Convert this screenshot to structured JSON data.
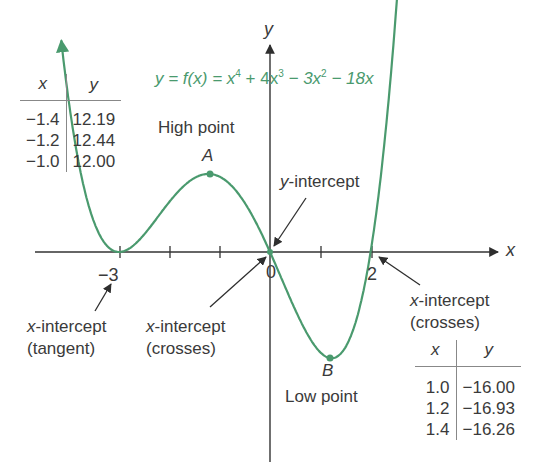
{
  "equation": {
    "lhs": "y = f(x) = ",
    "terms": [
      "x",
      "4",
      " + 4x",
      "3",
      " − 3x",
      "2",
      " − 18x"
    ],
    "text": "y = f(x) = x⁴ + 4x³ − 3x² − 18x",
    "color": "#4a9a6e"
  },
  "axes": {
    "x_label": "x",
    "y_label": "y",
    "tick_labels": {
      "neg3": "−3",
      "zero": "0",
      "two": "2"
    }
  },
  "annotations": {
    "high_point_label": "High point",
    "point_a": "A",
    "low_point_label": "Low point",
    "point_b": "B",
    "y_intercept": "y-intercept",
    "x_int_tangent_line1": "x-intercept",
    "x_int_tangent_line2": "(tangent)",
    "x_int_cross0_line1": "x-intercept",
    "x_int_cross0_line2": "(crosses)",
    "x_int_cross2_line1": "x-intercept",
    "x_int_cross2_line2": "(crosses)"
  },
  "table_high": {
    "headers": [
      "x",
      "y"
    ],
    "rows": [
      [
        "−1.4",
        "12.19"
      ],
      [
        "−1.2",
        "12.44"
      ],
      [
        "−1.0",
        "12.00"
      ]
    ]
  },
  "table_low": {
    "headers": [
      "x",
      "y"
    ],
    "rows": [
      [
        "1.0",
        "−16.00"
      ],
      [
        "1.2",
        "−16.93"
      ],
      [
        "1.4",
        "−16.26"
      ]
    ]
  },
  "chart_data": {
    "type": "line",
    "xlabel": "x",
    "ylabel": "y",
    "xlim": [
      -4.7,
      4.7
    ],
    "ylim": [
      -22,
      41
    ],
    "grid": false,
    "x_ticks": [
      -3,
      -2,
      -1,
      0,
      1,
      2
    ],
    "x_tick_labels": [
      "-3",
      "0",
      "2"
    ],
    "series": [
      {
        "name": "f(x)",
        "color": "#4a9a6e",
        "x": [
          -4.1,
          -3.5,
          -3,
          -2.5,
          -2,
          -1.5,
          -1.2,
          -1,
          -0.5,
          0,
          0.5,
          1,
          1.2,
          1.5,
          2,
          2.7
        ],
        "y": [
          18.0,
          4.4,
          0,
          3.1,
          8,
          11.8,
          12.44,
          12,
          7.6,
          0,
          -9.2,
          -16,
          -16.93,
          -16.3,
          0,
          27.9
        ]
      }
    ],
    "key_points": [
      {
        "label": "A (High point)",
        "x": -1.2,
        "y": 12.44
      },
      {
        "label": "B (Low point)",
        "x": 1.2,
        "y": -16.93
      },
      {
        "label": "x-intercept (tangent)",
        "x": -3,
        "y": 0
      },
      {
        "label": "x-intercept (crosses) / y-intercept",
        "x": 0,
        "y": 0
      },
      {
        "label": "x-intercept (crosses)",
        "x": 2,
        "y": 0
      }
    ],
    "tables": [
      {
        "x": [
          -1.4,
          -1.2,
          -1.0
        ],
        "y": [
          12.19,
          12.44,
          12.0
        ]
      },
      {
        "x": [
          1.0,
          1.2,
          1.4
        ],
        "y": [
          -16.0,
          -16.93,
          -16.26
        ]
      }
    ]
  }
}
